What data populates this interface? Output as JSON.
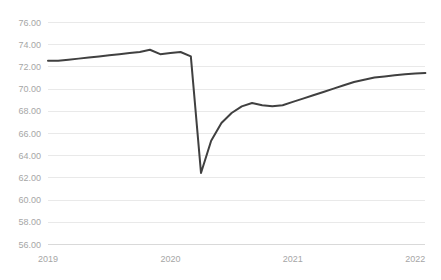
{
  "chart_data": {
    "type": "line",
    "title": "",
    "subtitle": "",
    "xlabel": "",
    "ylabel": "",
    "grid": "horizontal",
    "legend": null,
    "line_color": "#404040",
    "grid_color": "#e9e9e9",
    "tick_label_color": "#a6a6a6",
    "xlim": [
      2019.0,
      2022.08
    ],
    "ylim": [
      56.0,
      76.0
    ],
    "ytick_labels": [
      "76.00",
      "74.00",
      "72.00",
      "70.00",
      "68.00",
      "66.00",
      "64.00",
      "62.00",
      "60.00",
      "58.00",
      "56.00"
    ],
    "ytick_values": [
      76,
      74,
      72,
      70,
      68,
      66,
      64,
      62,
      60,
      58,
      56
    ],
    "xtick_labels": [
      "2019",
      "2020",
      "2021",
      "2022"
    ],
    "xtick_values": [
      2019,
      2020,
      2021,
      2022
    ],
    "series": [
      {
        "name": "series-1",
        "x": [
          2019.0,
          2019.083,
          2019.167,
          2019.25,
          2019.333,
          2019.417,
          2019.5,
          2019.583,
          2019.667,
          2019.75,
          2019.833,
          2019.917,
          2020.0,
          2020.083,
          2020.167,
          2020.25,
          2020.333,
          2020.417,
          2020.5,
          2020.583,
          2020.667,
          2020.75,
          2020.833,
          2020.917,
          2021.0,
          2021.083,
          2021.167,
          2021.25,
          2021.333,
          2021.417,
          2021.5,
          2021.583,
          2021.667,
          2021.75,
          2021.833,
          2021.917,
          2022.0,
          2022.083
        ],
        "values": [
          72.5,
          72.5,
          72.6,
          72.7,
          72.8,
          72.9,
          73.0,
          73.1,
          73.2,
          73.3,
          73.5,
          73.1,
          73.2,
          73.3,
          72.9,
          62.4,
          65.3,
          66.9,
          67.8,
          68.4,
          68.7,
          68.5,
          68.4,
          68.5,
          68.8,
          69.1,
          69.4,
          69.7,
          70.0,
          70.3,
          70.6,
          70.8,
          71.0,
          71.1,
          71.2,
          71.3,
          71.35,
          71.4
        ]
      }
    ]
  }
}
